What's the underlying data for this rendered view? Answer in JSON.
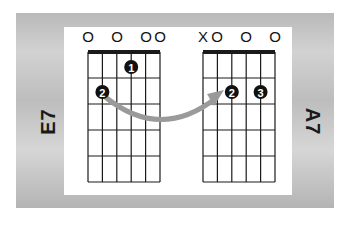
{
  "chords": [
    {
      "name": "E7",
      "open_markers": [
        "O",
        "",
        "O",
        "",
        "O",
        "O"
      ],
      "fingers": [
        {
          "number": "1",
          "string": 4,
          "fret": 1
        },
        {
          "number": "2",
          "string": 2,
          "fret": 2
        }
      ]
    },
    {
      "name": "A7",
      "open_markers": [
        "X",
        "O",
        "",
        "O",
        "",
        "O"
      ],
      "fingers": [
        {
          "number": "2",
          "string": 3,
          "fret": 2
        },
        {
          "number": "3",
          "string": 5,
          "fret": 2
        }
      ]
    }
  ],
  "transition_arrow": {
    "from": "E7 finger 2",
    "to": "A7 finger 2",
    "color": "#9a9a9a"
  },
  "colors": {
    "frame": "#c4c4c4",
    "panel": "#ffffff",
    "grid": "#1a1a1a",
    "dot": "#111111"
  }
}
